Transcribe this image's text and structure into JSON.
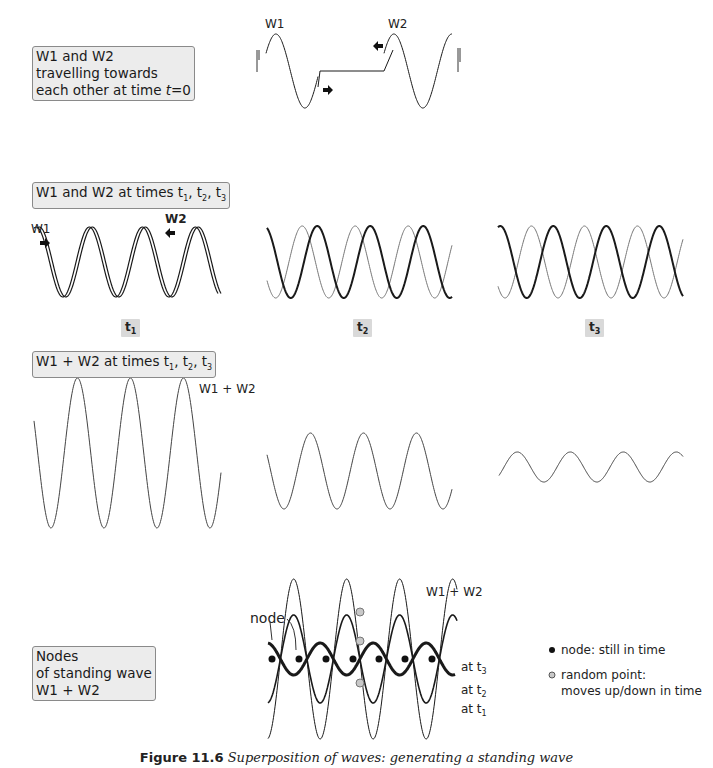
{
  "panels": {
    "travelling": {
      "label_lines": [
        "W1 and W2",
        "travelling towards",
        "each other at time "
      ],
      "label_var": "t",
      "label_eq": "=0",
      "w1_label": "W1",
      "w2_label": "W2"
    },
    "times": {
      "label_prefix": "W1 and W2 at times t",
      "subs": [
        "1",
        "2",
        "3"
      ],
      "w1_label": "W1",
      "w2_label": "W2",
      "time_labels": [
        {
          "base": "t",
          "sub": "1"
        },
        {
          "base": "t",
          "sub": "2"
        },
        {
          "base": "t",
          "sub": "3"
        }
      ]
    },
    "sum": {
      "label_prefix": "W1 + W2 at times t",
      "subs": [
        "1",
        "2",
        "3"
      ],
      "wave_label": "W1 + W2"
    },
    "nodes": {
      "label_lines": [
        "Nodes",
        "of standing wave",
        "W1 + W2"
      ],
      "node_label": "node",
      "wave_label": "W1 + W2",
      "at_labels": [
        {
          "base": "at t",
          "sub": "3"
        },
        {
          "base": "at t",
          "sub": "2"
        },
        {
          "base": "at t",
          "sub": "1"
        }
      ],
      "legend": [
        {
          "marker": "filled-dot",
          "color": "#111111",
          "text": "node: still in time"
        },
        {
          "marker": "open-dot",
          "color": "#bdbdbd",
          "text_lines": [
            "random point:",
            "moves up/down in time"
          ]
        }
      ]
    }
  },
  "caption": {
    "number": "Figure 11.6",
    "text": "Superposition of waves: generating a standing wave"
  },
  "colors": {
    "label_box_bg": "#ececec",
    "time_tag_bg": "#d9d9d9",
    "wave_dark": "#1a1a1a",
    "wave_light": "#777777",
    "random_point": "#c8c8c8"
  }
}
